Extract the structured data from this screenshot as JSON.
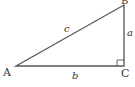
{
  "diagram": {
    "type": "right-triangle",
    "vertices": [
      {
        "name": "A",
        "x": 16,
        "y": 66
      },
      {
        "name": "B",
        "x": 124,
        "y": 5
      },
      {
        "name": "C",
        "x": 124,
        "y": 66
      }
    ],
    "right_angle_at": "C",
    "sides": [
      {
        "label": "c",
        "from": "A",
        "to": "B"
      },
      {
        "label": "a",
        "from": "B",
        "to": "C"
      },
      {
        "label": "b",
        "from": "A",
        "to": "C"
      }
    ],
    "vertex_labels": {
      "A": "A",
      "B": "B",
      "C": "C"
    },
    "side_labels": {
      "a": "a",
      "b": "b",
      "c": "c"
    },
    "stroke_color": "#555555"
  }
}
